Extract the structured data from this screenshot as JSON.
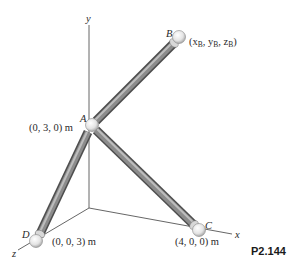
{
  "figure": {
    "problem_number": "P2.144",
    "axes": {
      "x_label": "x",
      "y_label": "y",
      "z_label": "z"
    },
    "points": {
      "A": {
        "label": "A",
        "coords": "(0, 3, 0) m"
      },
      "B": {
        "label": "B",
        "coords_open": "(x",
        "sub_x": "B",
        "sep1": ", y",
        "sub_y": "B",
        "sep2": ", z",
        "sub_z": "B",
        "coords_close": ")"
      },
      "C": {
        "label": "C",
        "coords": "(4, 0, 0) m"
      },
      "D": {
        "label": "D",
        "coords": "(0, 0, 3) m"
      }
    },
    "members": [
      "AB",
      "AC",
      "AD"
    ],
    "colors": {
      "axis_line": "#555555",
      "bar_dark": "#5a5a5a",
      "bar_mid": "#8a8a8a",
      "bar_light": "#c8c8c8",
      "joint": "#e6e6e6"
    }
  }
}
